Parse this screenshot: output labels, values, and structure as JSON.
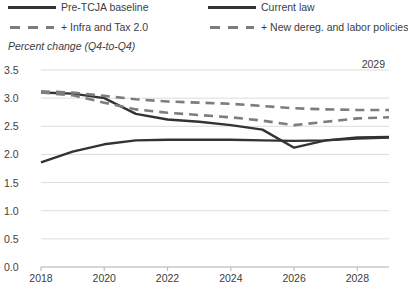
{
  "chart_data": {
    "type": "line",
    "title": "",
    "subtitle": "Percent change (Q4-to-Q4)",
    "xlabel": "",
    "ylabel": "",
    "annotation": "2029",
    "xlim": [
      2018,
      2029
    ],
    "ylim": [
      0.0,
      3.5
    ],
    "grid": true,
    "legend_position": "top",
    "xticks": [
      "2018",
      "2020",
      "2022",
      "2024",
      "2026",
      "2028"
    ],
    "xtick_values": [
      2018,
      2020,
      2022,
      2024,
      2026,
      2028
    ],
    "yticks": [
      "0.0",
      "0.5",
      "1.0",
      "1.5",
      "2.0",
      "2.5",
      "3.0",
      "3.5"
    ],
    "ytick_values": [
      0.0,
      0.5,
      1.0,
      1.5,
      2.0,
      2.5,
      3.0,
      3.5
    ],
    "x": [
      2018,
      2019,
      2020,
      2021,
      2022,
      2023,
      2024,
      2025,
      2026,
      2027,
      2028,
      2029
    ],
    "series": [
      {
        "name": "Pre-TCJA baseline",
        "style": "solid",
        "color": "#333333",
        "values": [
          3.1,
          3.08,
          3.0,
          2.72,
          2.62,
          2.58,
          2.52,
          2.44,
          2.12,
          2.25,
          2.3,
          2.31
        ]
      },
      {
        "name": "Current law",
        "style": "solid",
        "color": "#333333",
        "values": [
          1.86,
          2.05,
          2.18,
          2.25,
          2.26,
          2.26,
          2.26,
          2.25,
          2.24,
          2.25,
          2.28,
          2.3
        ]
      },
      {
        "name": "+ Infra and Tax 2.0",
        "style": "dashed",
        "color": "#7d7d7d",
        "values": [
          3.12,
          3.1,
          3.04,
          2.98,
          2.94,
          2.92,
          2.9,
          2.86,
          2.82,
          2.8,
          2.79,
          2.79
        ]
      },
      {
        "name": "+ New dereg. and labor policies",
        "style": "dashed",
        "color": "#7d7d7d",
        "values": [
          3.1,
          3.05,
          2.92,
          2.8,
          2.74,
          2.7,
          2.66,
          2.6,
          2.52,
          2.58,
          2.64,
          2.66
        ]
      }
    ]
  },
  "legend": {
    "items": [
      {
        "label": "Pre-TCJA baseline",
        "style": "solid"
      },
      {
        "label": "+ Infra and Tax 2.0",
        "style": "dashed"
      },
      {
        "label": "Current law",
        "style": "solid"
      },
      {
        "label": "+ New dereg. and labor policies",
        "style": "dashed"
      }
    ]
  },
  "colors": {
    "solid_line": "#333333",
    "dashed_line": "#7d7d7d",
    "grid": "#dcdcdc",
    "axis": "#bfbfbf",
    "text": "#3d3d3d",
    "background": "#ffffff"
  }
}
